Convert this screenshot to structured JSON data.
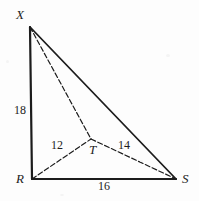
{
  "figure": {
    "background_color": "#fdfdfd",
    "stroke_color": "#1c1c1c",
    "vertices": [
      {
        "id": "X",
        "label": "X",
        "x": 30,
        "y": 27,
        "label_x": 16,
        "label_y": 8
      },
      {
        "id": "R",
        "label": "R",
        "x": 32,
        "y": 179,
        "label_x": 16,
        "label_y": 172
      },
      {
        "id": "S",
        "label": "S",
        "x": 176,
        "y": 179,
        "label_x": 182,
        "label_y": 172
      },
      {
        "id": "T",
        "label": "T",
        "x": 91,
        "y": 139,
        "label_x": 89,
        "label_y": 143
      }
    ],
    "edges": [
      {
        "id": "XR",
        "from": "X",
        "to": "R",
        "style": "solid",
        "width": 2.2
      },
      {
        "id": "XS",
        "from": "X",
        "to": "S",
        "style": "solid",
        "width": 1.8
      },
      {
        "id": "RS",
        "from": "R",
        "to": "S",
        "style": "solid",
        "width": 2.2
      },
      {
        "id": "XT",
        "from": "X",
        "to": "T",
        "style": "dashed",
        "width": 1.2
      },
      {
        "id": "RT",
        "from": "R",
        "to": "T",
        "style": "dashed",
        "width": 1.2
      },
      {
        "id": "TS",
        "from": "T",
        "to": "S",
        "style": "dashed",
        "width": 1.2
      }
    ],
    "measurements": [
      {
        "id": "XR-length",
        "edge": "XR",
        "value": "18",
        "x": 14,
        "y": 104
      },
      {
        "id": "RT-length",
        "edge": "RT",
        "value": "12",
        "x": 51,
        "y": 139
      },
      {
        "id": "TS-length",
        "edge": "TS",
        "value": "14",
        "x": 118,
        "y": 139
      },
      {
        "id": "RS-length",
        "edge": "RS",
        "value": "16",
        "x": 98,
        "y": 180
      }
    ]
  }
}
